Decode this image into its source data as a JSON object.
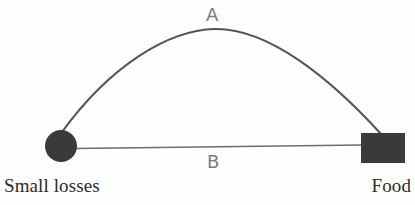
{
  "diagram": {
    "type": "node-link-diagram",
    "background_color": "#fefefe",
    "nodes": [
      {
        "id": "small-losses",
        "label": "Small losses",
        "shape": "circle",
        "fill_color": "#3a3a3a",
        "cx": 61,
        "cy": 146,
        "r": 16
      },
      {
        "id": "food",
        "label": "Food",
        "shape": "rectangle",
        "fill_color": "#3a3a3a",
        "x": 361,
        "y": 133,
        "width": 44,
        "height": 30
      }
    ],
    "edges": [
      {
        "id": "path-a",
        "label": "A",
        "style": "curved-arc",
        "stroke_color": "#555555",
        "stroke_width": 2.1,
        "label_color": "#7b7b7b"
      },
      {
        "id": "path-b",
        "label": "B",
        "style": "straight-line",
        "stroke_color": "#6d6d6d",
        "stroke_width": 1.6,
        "label_color": "#7b7b7b"
      }
    ]
  }
}
